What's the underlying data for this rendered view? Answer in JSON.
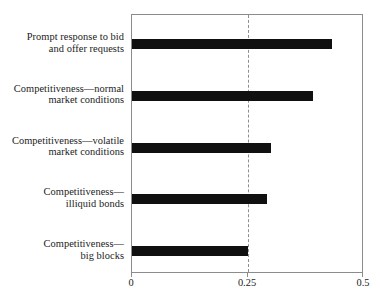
{
  "chart_data": {
    "type": "bar",
    "orientation": "horizontal",
    "title": "",
    "subtitle": "",
    "xlabel": "",
    "ylabel": "",
    "xlim": [
      0,
      0.5
    ],
    "ylim": null,
    "grid": false,
    "legend": null,
    "legend_position": "none",
    "xticks": [
      "0",
      "0.25",
      "0.5"
    ],
    "xtick_values": [
      0,
      0.25,
      0.5
    ],
    "categories": [
      "Prompt response to bid and offer requests",
      "Competitiveness—normal market conditions",
      "Competitiveness—volatile market conditions",
      "Competitiveness—illiquid bonds",
      "Competitiveness—big blocks"
    ],
    "category_lines": [
      [
        "Prompt response to bid",
        "and offer requests"
      ],
      [
        "Competitiveness—normal",
        "market conditions"
      ],
      [
        "Competitiveness—volatile",
        "market conditions"
      ],
      [
        "Competitiveness—",
        "illiquid bonds"
      ],
      [
        "Competitiveness—",
        "big blocks"
      ]
    ],
    "values": [
      0.43,
      0.39,
      0.3,
      0.29,
      0.25
    ],
    "bar_color": "#101010",
    "frame_color": "#8c8c8c",
    "annotations": [
      {
        "type": "reference-line",
        "value": 0.25,
        "style": "dashed",
        "color": "#8f8f8f"
      }
    ]
  }
}
